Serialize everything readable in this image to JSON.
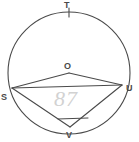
{
  "diagram": {
    "type": "circle-geometry",
    "background_color": "#ffffff",
    "stroke_color": "#4a4a4a",
    "annotation_color": "#d2d2d2",
    "circle": {
      "center_label": "O",
      "center_x": 69,
      "center_y": 73,
      "radius": 61
    },
    "points": [
      {
        "label": "T",
        "x": 69,
        "y": 12,
        "position": "top",
        "on_circle": true,
        "tick_mark": true
      },
      {
        "label": "O",
        "x": 69,
        "y": 73,
        "position": "center",
        "on_circle": false,
        "tick_mark": false
      },
      {
        "label": "S",
        "x": 12,
        "y": 88,
        "position": "left",
        "on_circle": true,
        "tick_mark": false
      },
      {
        "label": "U",
        "x": 122,
        "y": 85,
        "position": "right",
        "on_circle": true,
        "tick_mark": false
      },
      {
        "label": "V",
        "x": 70,
        "y": 127,
        "position": "bottom",
        "on_circle": true,
        "tick_mark": false
      }
    ],
    "segments": [
      {
        "name": "radius-OS",
        "from": "O",
        "to": "S"
      },
      {
        "name": "radius-OU",
        "from": "O",
        "to": "U"
      },
      {
        "name": "chord-SV",
        "from": "S",
        "to": "V"
      },
      {
        "name": "chord-UV",
        "from": "U",
        "to": "V"
      },
      {
        "name": "chord-SU",
        "from": "S",
        "to": "U"
      }
    ],
    "angle_mark": {
      "name": "angle-mark-at-V",
      "at_vertex": "V",
      "style": "straight-tick"
    },
    "handwritten_annotation": {
      "text": "87",
      "style": "faint-pencil"
    }
  }
}
